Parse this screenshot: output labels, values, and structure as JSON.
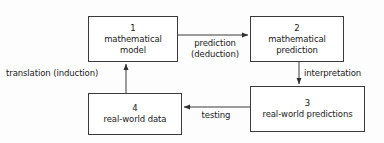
{
  "diagram": {
    "background_color": "#fdfdfd",
    "line_color": "#3a3a3a",
    "text_color": "#1a1a1a",
    "nodes": [
      {
        "id": "1",
        "number": "1",
        "label": "mathematical\nmodel"
      },
      {
        "id": "2",
        "number": "2",
        "label": "mathematical\nprediction"
      },
      {
        "id": "3",
        "number": "3",
        "label": "real-world predictions"
      },
      {
        "id": "4",
        "number": "4",
        "label": "real-world data"
      }
    ],
    "edges": [
      {
        "id": "e1",
        "from": "1",
        "to": "2",
        "label": "prediction\n(deduction)",
        "direction": "right"
      },
      {
        "id": "e2",
        "from": "2",
        "to": "3",
        "label": "interpretation",
        "direction": "down"
      },
      {
        "id": "e3",
        "from": "3",
        "to": "4",
        "label": "testing",
        "direction": "left"
      },
      {
        "id": "e4",
        "from": "4",
        "to": "1",
        "label": "translation (induction)",
        "direction": "up"
      }
    ]
  }
}
